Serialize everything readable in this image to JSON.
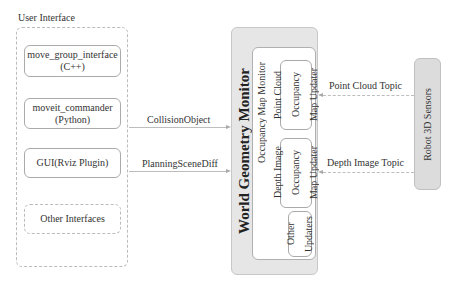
{
  "user_interface": {
    "title": "User Interface",
    "items": [
      {
        "line1": "move_group_interface",
        "line2": "(C++)"
      },
      {
        "line1": "moveit_commander",
        "line2": "(Python)"
      },
      {
        "line1": "GUI(Rviz Plugin)",
        "line2": ""
      },
      {
        "line1": "Other Interfaces",
        "line2": ""
      }
    ]
  },
  "messages": {
    "collision_object": "CollisionObject",
    "planning_scene_diff": "PlanningSceneDiff",
    "point_cloud_topic": "Point Cloud Topic",
    "depth_image_topic": "Depth Image Topic"
  },
  "world_geometry_monitor": {
    "title": "World Geometry Monitor",
    "occupancy_map_monitor": {
      "title": "Occupancy Map Monitor",
      "updaters": [
        {
          "line1": "Point Cloud",
          "line2": "Occupancy",
          "line3": "Map Updater"
        },
        {
          "line1": "Depth Image",
          "line2": "Occupancy",
          "line3": "Map Updater"
        },
        {
          "line1": "Other",
          "line2": "Updaters",
          "line3": ""
        }
      ]
    }
  },
  "sensors": {
    "label": "Robot 3D Sensors"
  },
  "colors": {
    "wgm_fill": "#e6e6e6",
    "sensors_fill": "#dcdcdc",
    "line": "#bdbdbd"
  }
}
